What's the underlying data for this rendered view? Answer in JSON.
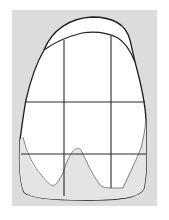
{
  "diagram": {
    "colors": {
      "page_bg": "#ffffff",
      "panel_bg": "#dcdcdc",
      "crown_fill": "#ffffff",
      "incisal_shade": "#e4e4e4",
      "outline": "#1e1e1e",
      "grid": "#2a2a2a"
    },
    "grid": {
      "vertical_lines_x": [
        64,
        111
      ],
      "horizontal_lines_y": [
        102,
        154
      ]
    }
  }
}
